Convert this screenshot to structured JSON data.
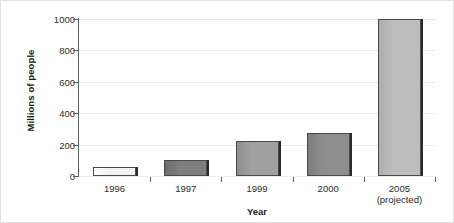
{
  "chart_data": {
    "type": "bar",
    "title": "",
    "subtitle": "",
    "xlabel": "Year",
    "ylabel": "Millions of people",
    "categories": [
      "1996",
      "1997",
      "1999",
      "2000",
      "2005"
    ],
    "category_sublabels": [
      "",
      "",
      "",
      "",
      "(projected)"
    ],
    "values": [
      55,
      100,
      225,
      275,
      1000
    ],
    "ylim": [
      0,
      1000
    ],
    "yticks": [
      0,
      200,
      400,
      600,
      800,
      1000
    ],
    "ytick_labels": [
      "0",
      "200",
      "400",
      "600",
      "800",
      "1000"
    ],
    "grid": true,
    "grid_axis": "y",
    "legend": false,
    "legend_position": "none",
    "bar_colors": [
      "#f2f2f2",
      "#7e7e7e",
      "#a0a0a0",
      "#8e8e8e",
      "#bdbdbd"
    ],
    "bar_gradient_colors": [
      "#ffffff",
      "#6d6d6d",
      "#8e8e8e",
      "#7d7d7d",
      "#adadad"
    ],
    "bar_edge_color": "#4a4a4a",
    "bar_shadow_color": "#2a2a2a",
    "axis_color": "#5c5c5c",
    "gridline_color": "#ececec",
    "background_color": "#ffffff",
    "text_color": "#2b2b2b"
  }
}
